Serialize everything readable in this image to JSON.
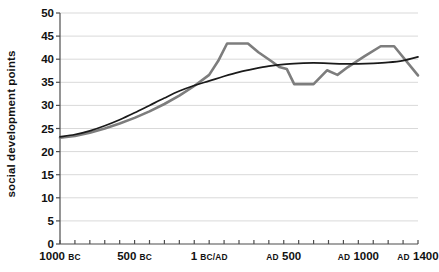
{
  "chart_data": {
    "type": "line",
    "title": "",
    "xlabel": "",
    "ylabel": "social development points",
    "ylim": [
      0,
      50
    ],
    "ytick_step": 5,
    "yticks": [
      50,
      45,
      40,
      35,
      30,
      25,
      20,
      15,
      10,
      5,
      0
    ],
    "ytick_labels": [
      "50",
      "45",
      "40",
      "35",
      "30",
      "25",
      "20",
      "15",
      "10",
      "5",
      "0"
    ],
    "xlim": [
      -1000,
      1400
    ],
    "xticks": [
      -1000,
      -500,
      1,
      500,
      1000,
      1400
    ],
    "xtick_labels": [
      {
        "main_before": "1000",
        "small": "BC",
        "small_before": false
      },
      {
        "main_before": "500",
        "small": "BC",
        "small_before": false
      },
      {
        "main_before": "1",
        "small": "BC/AD",
        "small_before": false
      },
      {
        "main_before": "500",
        "small": "AD",
        "small_before": true
      },
      {
        "main_before": "1000",
        "small": "AD",
        "small_before": true
      },
      {
        "main_before": "1400",
        "small": "AD",
        "small_before": true
      }
    ],
    "xtick_minor_step": 100,
    "grid": "horizontal",
    "legend": "none",
    "series": [
      {
        "name": "social development (gray)",
        "color": "#7d7d7d",
        "width": 2.6,
        "smooth": false,
        "x": [
          -1000,
          -900,
          -800,
          -700,
          -600,
          -500,
          -400,
          -300,
          -200,
          -100,
          1,
          100,
          200,
          300,
          400,
          500,
          600,
          700,
          800,
          900,
          1000,
          1100,
          1200,
          1300,
          1400
        ],
        "y": [
          23.0,
          23.5,
          24.3,
          25.3,
          26.4,
          27.6,
          29.0,
          30.6,
          32.4,
          34.4,
          37.0,
          41.5,
          43.5,
          43.5,
          43.3,
          42.5,
          38.3,
          37.8,
          34.5,
          34.5,
          37.5,
          38.7,
          38.0,
          39.6,
          41.5
        ]
      },
      {
        "name": "social development (black smooth trend)",
        "color": "#1a1a1a",
        "width": 1.7,
        "smooth": true,
        "x": [
          -1000,
          -900,
          -800,
          -700,
          -600,
          -500,
          -400,
          -300,
          -200,
          -100,
          1,
          100,
          200,
          300,
          400,
          500,
          600,
          700,
          800,
          900,
          1000,
          1100,
          1200,
          1300,
          1400
        ],
        "y": [
          23.2,
          23.7,
          24.5,
          25.6,
          26.9,
          28.4,
          30.0,
          31.6,
          33.1,
          34.3,
          35.3,
          36.3,
          37.2,
          37.9,
          38.5,
          38.9,
          39.1,
          39.2,
          39.1,
          39.0,
          39.0,
          39.1,
          39.3,
          39.7,
          40.5
        ]
      }
    ],
    "gray_overlay": {
      "name": "gray continuation right",
      "color": "#7d7d7d",
      "x": [
        1300,
        1400
      ],
      "y": [
        42.8,
        36.5
      ]
    },
    "gray_actual": {
      "comment": "full gray polyline as read from pixels",
      "points": [
        [
          -1000,
          23.0
        ],
        [
          -900,
          23.4
        ],
        [
          -800,
          24.1
        ],
        [
          -700,
          25.0
        ],
        [
          -600,
          26.1
        ],
        [
          -500,
          27.3
        ],
        [
          -400,
          28.7
        ],
        [
          -300,
          30.3
        ],
        [
          -200,
          32.1
        ],
        [
          -100,
          34.2
        ],
        [
          0,
          36.6
        ],
        [
          60,
          39.6
        ],
        [
          120,
          43.4
        ],
        [
          260,
          43.4
        ],
        [
          330,
          41.5
        ],
        [
          420,
          39.5
        ],
        [
          470,
          38.3
        ],
        [
          520,
          37.9
        ],
        [
          570,
          34.6
        ],
        [
          700,
          34.6
        ],
        [
          790,
          37.6
        ],
        [
          860,
          36.6
        ],
        [
          930,
          38.3
        ],
        [
          1040,
          40.6
        ],
        [
          1150,
          42.8
        ],
        [
          1240,
          42.8
        ],
        [
          1400,
          36.5
        ]
      ]
    }
  },
  "axis_style": {
    "axis_color": "#4d4d4d",
    "grid_color": "#d9d9d9",
    "text_color": "#111111",
    "background": "#ffffff"
  }
}
